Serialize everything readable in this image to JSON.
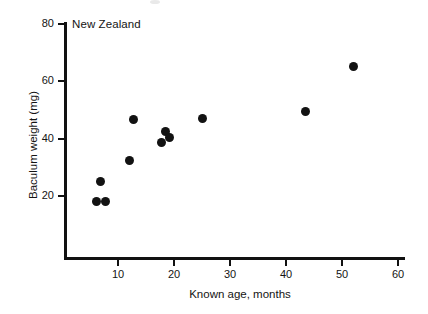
{
  "figure": {
    "panel_label": "New Zealand",
    "background_color": "#ffffff",
    "axis_color": "#111111",
    "marker_color": "#121212"
  },
  "chart_data": {
    "type": "scatter",
    "title": "New Zealand",
    "xlabel": "Known age, months",
    "ylabel": "Baculum weight (mg)",
    "xlim": [
      0,
      60
    ],
    "ylim": [
      0,
      80
    ],
    "xticks": [
      10,
      20,
      30,
      40,
      50,
      60
    ],
    "yticks": [
      20,
      40,
      60,
      80
    ],
    "grid": false,
    "legend": null,
    "series": [
      {
        "name": "New Zealand stoats",
        "marker": "filled-circle",
        "color": "#121212",
        "points": [
          {
            "x": 6.1,
            "y": 18.0
          },
          {
            "x": 7.7,
            "y": 18.0
          },
          {
            "x": 6.8,
            "y": 25.0
          },
          {
            "x": 12.0,
            "y": 32.5
          },
          {
            "x": 12.8,
            "y": 46.5
          },
          {
            "x": 17.8,
            "y": 38.5
          },
          {
            "x": 18.5,
            "y": 42.5
          },
          {
            "x": 19.2,
            "y": 40.5
          },
          {
            "x": 25.0,
            "y": 47.0
          },
          {
            "x": 43.5,
            "y": 49.5
          },
          {
            "x": 52.0,
            "y": 65.0
          }
        ]
      }
    ]
  },
  "axes": {
    "x": {
      "label": "Known age, months",
      "tick_labels": [
        "10",
        "20",
        "30",
        "40",
        "50",
        "60"
      ],
      "tick_values": [
        10,
        20,
        30,
        40,
        50,
        60
      ]
    },
    "y": {
      "label": "Baculum weight (mg)",
      "tick_labels": [
        "20",
        "40",
        "60",
        "80"
      ],
      "tick_values": [
        20,
        40,
        60,
        80
      ]
    }
  }
}
